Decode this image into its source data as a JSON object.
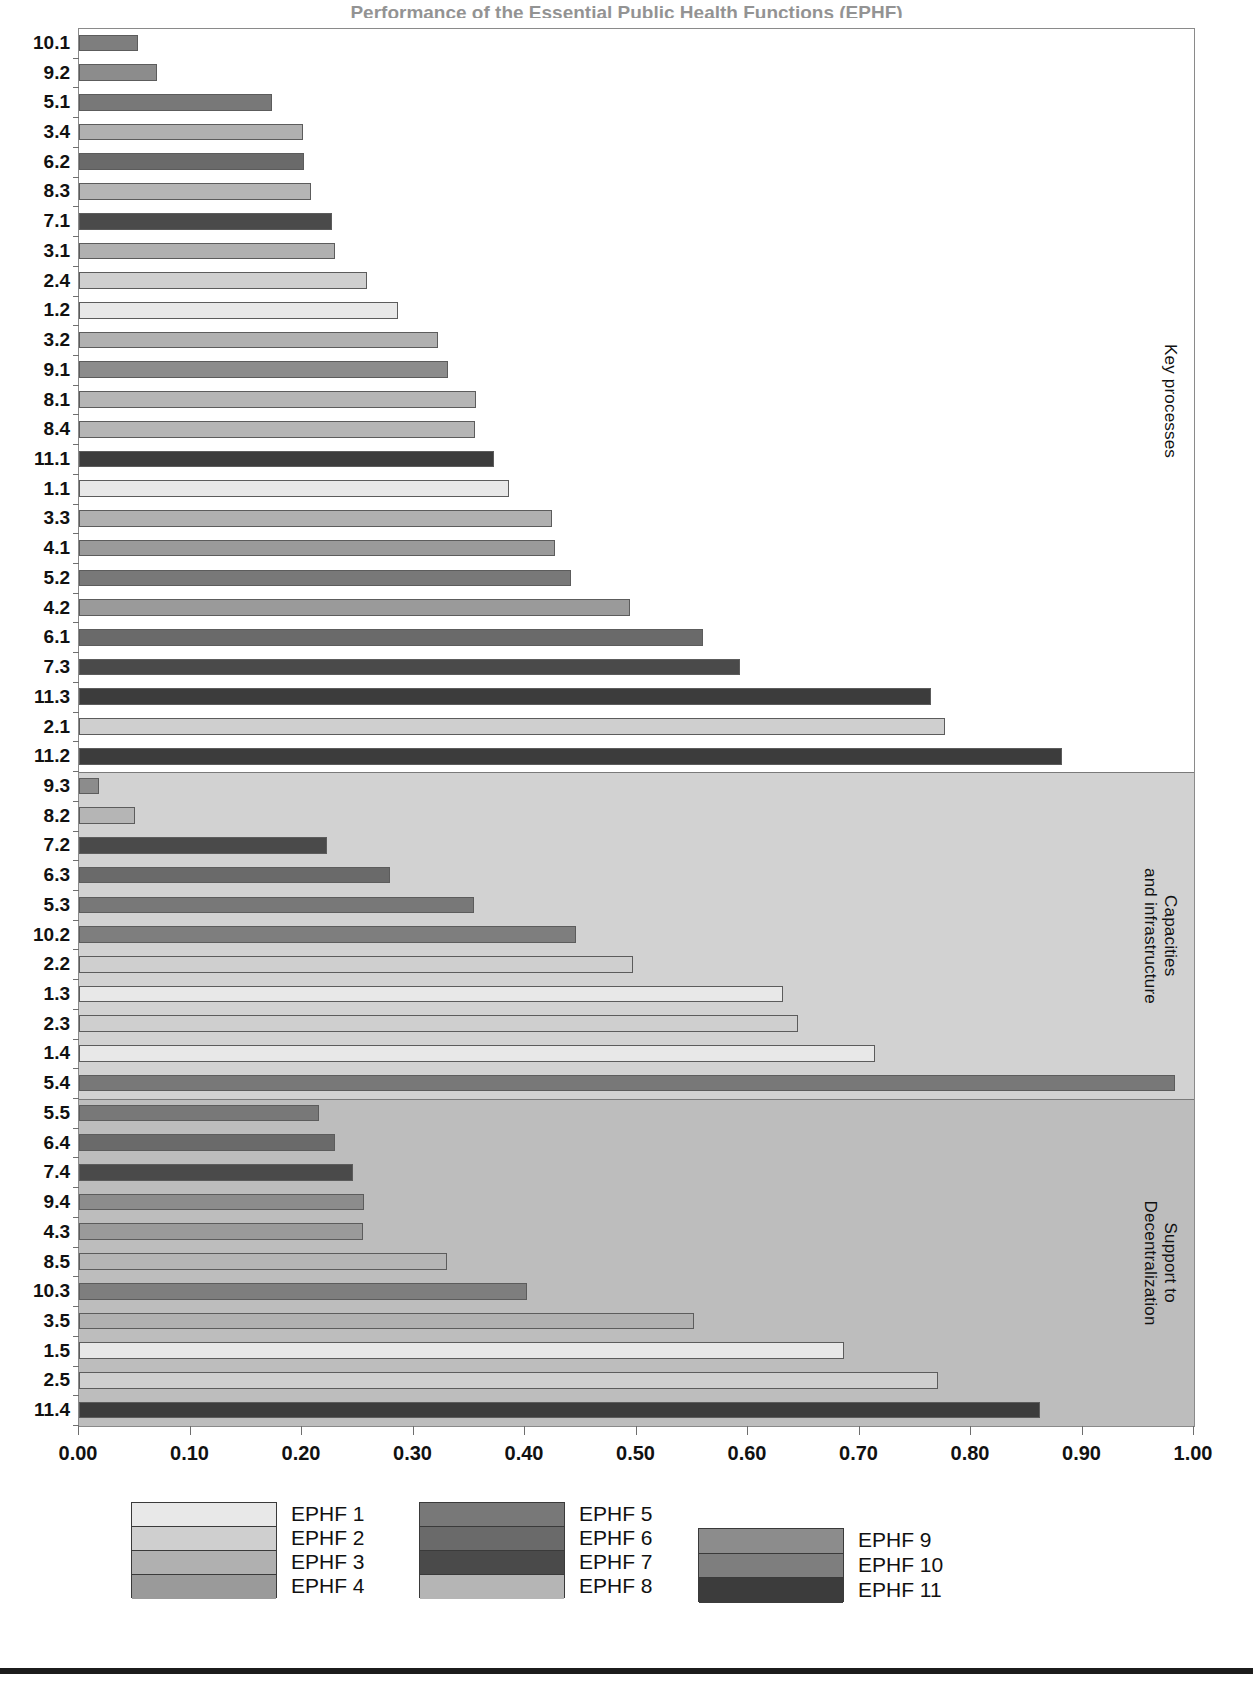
{
  "clipped_title": "Performance of the Essential Public Health Functions (EPHF)",
  "axis": {
    "x_ticks": [
      "0.00",
      "0.10",
      "0.20",
      "0.30",
      "0.40",
      "0.50",
      "0.60",
      "0.70",
      "0.80",
      "0.90",
      "1.00"
    ],
    "x_min": 0.0,
    "x_max": 1.0
  },
  "bands": [
    {
      "id": "key-processes",
      "label_lines": [
        "Key processes"
      ],
      "fill": "#ffffff"
    },
    {
      "id": "capacities-and-infrastructure",
      "label_lines": [
        "Capacities",
        "and infrastructure"
      ],
      "fill": "#d2d2d2"
    },
    {
      "id": "support-to-decentralization",
      "label_lines": [
        "Support to",
        "Decentralization"
      ],
      "fill": "#bdbdbd"
    }
  ],
  "legend": {
    "groups": [
      {
        "items": [
          {
            "label": "EPHF 1",
            "color": "#e8e8e8"
          },
          {
            "label": "EPHF 2",
            "color": "#cfcfcf"
          },
          {
            "label": "EPHF 3",
            "color": "#b0b0b0"
          },
          {
            "label": "EPHF 4",
            "color": "#9a9a9a"
          }
        ]
      },
      {
        "items": [
          {
            "label": "EPHF 5",
            "color": "#787878"
          },
          {
            "label": "EPHF 6",
            "color": "#6a6a6a"
          },
          {
            "label": "EPHF 7",
            "color": "#4a4a4a"
          },
          {
            "label": "EPHF 8",
            "color": "#b5b5b5"
          }
        ]
      },
      {
        "items": [
          {
            "label": "EPHF 9",
            "color": "#8c8c8c"
          },
          {
            "label": "EPHF 10",
            "color": "#7e7e7e"
          },
          {
            "label": "EPHF 11",
            "color": "#3c3c3c"
          }
        ]
      }
    ]
  },
  "chart_data": {
    "type": "bar",
    "orientation": "horizontal",
    "title": "Performance of the Essential Public Health Functions (EPHF)",
    "xlabel": "",
    "ylabel": "",
    "xlim": [
      0.0,
      1.0
    ],
    "grid": false,
    "legend_position": "bottom",
    "series_colors": {
      "EPHF 1": "#e8e8e8",
      "EPHF 2": "#cfcfcf",
      "EPHF 3": "#b0b0b0",
      "EPHF 4": "#9a9a9a",
      "EPHF 5": "#787878",
      "EPHF 6": "#6a6a6a",
      "EPHF 7": "#4a4a4a",
      "EPHF 8": "#b5b5b5",
      "EPHF 9": "#8c8c8c",
      "EPHF 10": "#7e7e7e",
      "EPHF 11": "#3c3c3c"
    },
    "groups": [
      {
        "name": "Key processes",
        "categories": [
          "10.1",
          "9.2",
          "5.1",
          "3.4",
          "6.2",
          "8.3",
          "7.1",
          "3.1",
          "2.4",
          "1.2",
          "3.2",
          "9.1",
          "8.1",
          "8.4",
          "11.1",
          "1.1",
          "3.3",
          "4.1",
          "5.2",
          "4.2",
          "6.1",
          "7.3",
          "11.3",
          "2.1",
          "11.2"
        ],
        "values": [
          0.053,
          0.07,
          0.173,
          0.201,
          0.202,
          0.208,
          0.227,
          0.23,
          0.258,
          0.286,
          0.322,
          0.331,
          0.356,
          0.355,
          0.372,
          0.386,
          0.424,
          0.427,
          0.441,
          0.494,
          0.56,
          0.593,
          0.764,
          0.777,
          0.882
        ],
        "ephf": [
          "EPHF 10",
          "EPHF 9",
          "EPHF 5",
          "EPHF 3",
          "EPHF 6",
          "EPHF 8",
          "EPHF 7",
          "EPHF 3",
          "EPHF 2",
          "EPHF 1",
          "EPHF 3",
          "EPHF 9",
          "EPHF 8",
          "EPHF 8",
          "EPHF 11",
          "EPHF 1",
          "EPHF 3",
          "EPHF 4",
          "EPHF 5",
          "EPHF 4",
          "EPHF 6",
          "EPHF 7",
          "EPHF 11",
          "EPHF 2",
          "EPHF 11"
        ]
      },
      {
        "name": "Capacities and infrastructure",
        "categories": [
          "9.3",
          "8.2",
          "7.2",
          "6.3",
          "5.3",
          "10.2",
          "2.2",
          "1.3",
          "2.3",
          "1.4",
          "5.4"
        ],
        "values": [
          0.018,
          0.05,
          0.222,
          0.279,
          0.354,
          0.446,
          0.497,
          0.631,
          0.645,
          0.714,
          0.983
        ],
        "ephf": [
          "EPHF 9",
          "EPHF 8",
          "EPHF 7",
          "EPHF 6",
          "EPHF 5",
          "EPHF 10",
          "EPHF 2",
          "EPHF 1",
          "EPHF 2",
          "EPHF 1",
          "EPHF 5"
        ]
      },
      {
        "name": "Support to Decentralization",
        "categories": [
          "5.5",
          "6.4",
          "7.4",
          "9.4",
          "4.3",
          "8.5",
          "10.3",
          "3.5",
          "1.5",
          "2.5",
          "11.4"
        ],
        "values": [
          0.215,
          0.23,
          0.246,
          0.256,
          0.255,
          0.33,
          0.402,
          0.552,
          0.686,
          0.77,
          0.862
        ],
        "ephf": [
          "EPHF 5",
          "EPHF 6",
          "EPHF 7",
          "EPHF 9",
          "EPHF 4",
          "EPHF 8",
          "EPHF 10",
          "EPHF 3",
          "EPHF 1",
          "EPHF 2",
          "EPHF 11"
        ]
      }
    ]
  }
}
